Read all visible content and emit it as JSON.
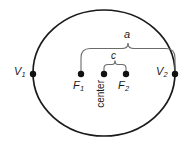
{
  "figure": {
    "type": "ellipse-geometry-diagram",
    "canvas": {
      "width": 193,
      "height": 146
    },
    "colors": {
      "background": "#ffffff",
      "ellipse_stroke": "#1a1a1a",
      "brace_stroke": "#6b6b6b",
      "point_fill": "#111111",
      "label_text": "#1a1a1a"
    }
  },
  "ellipse": {
    "center_x": 104,
    "center_y": 73,
    "semi_major_a": 71,
    "semi_minor_b": 63,
    "stroke_width": 1.6
  },
  "points": [
    {
      "id": "v1",
      "label": "V",
      "subscript": "1",
      "x": 33,
      "y": 74,
      "role": "vertex-left"
    },
    {
      "id": "f1",
      "label": "F",
      "subscript": "1",
      "x": 81,
      "y": 74,
      "role": "focus-left"
    },
    {
      "id": "center",
      "label": "center",
      "subscript": "",
      "x": 104,
      "y": 74,
      "role": "center"
    },
    {
      "id": "f2",
      "label": "F",
      "subscript": "2",
      "x": 126,
      "y": 74,
      "role": "focus-right"
    },
    {
      "id": "v2",
      "label": "V",
      "subscript": "2",
      "x": 175,
      "y": 74,
      "role": "vertex-right"
    }
  ],
  "labels": {
    "v1_letter": "V",
    "v1_sub": "1",
    "v2_letter": "V",
    "v2_sub": "2",
    "f1_letter": "F",
    "f1_sub": "1",
    "f2_letter": "F",
    "f2_sub": "2",
    "center": "center",
    "a": "a",
    "c": "c"
  },
  "braces": [
    {
      "id": "brace-a",
      "label": "a",
      "meaning": "semi-major-axis",
      "left_x": 81,
      "right_x": 175,
      "top_y": 47,
      "label_x": 128,
      "label_y": 35,
      "span_from": "f1",
      "span_to": "v2"
    },
    {
      "id": "brace-c",
      "label": "c",
      "meaning": "center-to-focus-distance",
      "left_x": 104,
      "right_x": 126,
      "top_y": 64,
      "label_x": 115,
      "label_y": 56,
      "span_from": "center",
      "span_to": "f2"
    }
  ]
}
